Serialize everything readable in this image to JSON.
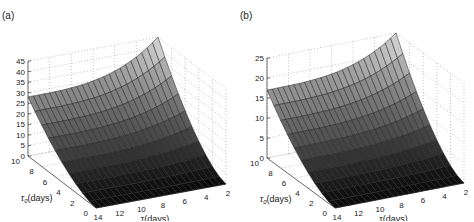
{
  "chart_data": [
    {
      "panel_label": "(a)",
      "type": "surface3d",
      "xlabel": "τ(days)",
      "ylabel": "τ_0(days)",
      "zlabel": "",
      "x_ticks": [
        14,
        12,
        10,
        8,
        6,
        4,
        2
      ],
      "y_ticks": [
        0,
        2,
        4,
        6,
        8,
        10
      ],
      "z_ticks": [
        0,
        5,
        10,
        15,
        20,
        25,
        30,
        35,
        40,
        45
      ],
      "xlim": [
        2,
        14
      ],
      "ylim": [
        0,
        10
      ],
      "zlim": [
        0,
        45
      ],
      "grid": true,
      "colormap": "gray",
      "description": "Surface rises with τ_0; near-zero at τ_0=0, about 28 at τ_0=10, τ=14, peaking ~45 at τ_0=10, τ=2",
      "corner_values": {
        "tau0_0_tau14": 0,
        "tau0_0_tau2": 0,
        "tau0_10_tau14": 28,
        "tau0_10_tau2": 45
      }
    },
    {
      "panel_label": "(b)",
      "type": "surface3d",
      "xlabel": "τ(days)",
      "ylabel": "τ_0(days)",
      "zlabel": "",
      "x_ticks": [
        14,
        12,
        10,
        8,
        6,
        4,
        2
      ],
      "y_ticks": [
        0,
        2,
        4,
        6,
        8,
        10
      ],
      "z_ticks": [
        0,
        5,
        10,
        15,
        20,
        25
      ],
      "xlim": [
        2,
        14
      ],
      "ylim": [
        0,
        10
      ],
      "zlim": [
        0,
        25
      ],
      "grid": true,
      "colormap": "gray",
      "description": "Surface rises with τ_0; near-zero at τ_0=0, about 17 at τ_0=10, τ=14, peaking ~25 at τ_0=10, τ=2",
      "corner_values": {
        "tau0_0_tau14": 0,
        "tau0_0_tau2": 0,
        "tau0_10_tau14": 17,
        "tau0_10_tau2": 25
      }
    }
  ],
  "panels": {
    "a": {
      "label": "(a)",
      "xlabel": "τ(days)",
      "ylabel_main": "τ",
      "ylabel_sub": "0",
      "ylabel_rest": "(days)",
      "z_ticks": [
        "0",
        "5",
        "10",
        "15",
        "20",
        "25",
        "30",
        "35",
        "40",
        "45"
      ],
      "y_ticks": [
        "0",
        "2",
        "4",
        "6",
        "8",
        "10"
      ],
      "x_ticks": [
        "14",
        "12",
        "10",
        "8",
        "6",
        "4",
        "2"
      ]
    },
    "b": {
      "label": "(b)",
      "xlabel": "τ(days)",
      "ylabel_main": "τ",
      "ylabel_sub": "0",
      "ylabel_rest": "(days)",
      "z_ticks": [
        "0",
        "5",
        "10",
        "15",
        "20",
        "25"
      ],
      "y_ticks": [
        "0",
        "2",
        "4",
        "6",
        "8",
        "10"
      ],
      "x_ticks": [
        "14",
        "12",
        "10",
        "8",
        "6",
        "4",
        "2"
      ]
    }
  }
}
